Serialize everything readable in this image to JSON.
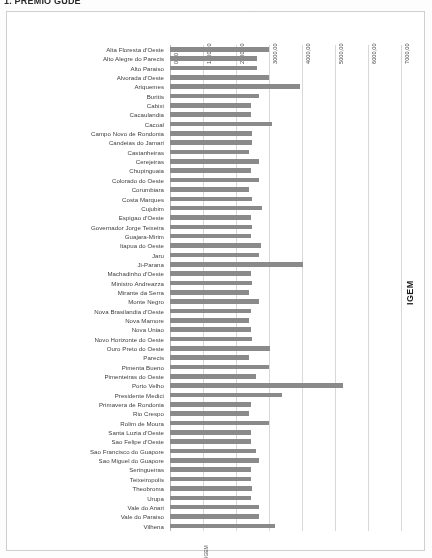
{
  "document": {
    "title": "1. PREMIO GUDE"
  },
  "series_label": "IGEM",
  "bottom_label": "IGEM",
  "chart_data": {
    "type": "bar",
    "orientation": "horizontal",
    "title": "1. PREMIO GUDE",
    "xlabel": "",
    "ylabel": "",
    "legend": [
      "IGEM"
    ],
    "legend_position": "right",
    "grid": true,
    "xlim": [
      0,
      7500
    ],
    "xticks": [
      0,
      1000,
      2000,
      3000,
      4000,
      5000,
      6000,
      7000
    ],
    "xtick_labels": [
      "0,00",
      "1000,00",
      "2000,00",
      "3000,00",
      "4000,00",
      "5000,00",
      "6000,00",
      "7000,00"
    ],
    "categories": [
      "Alta Floresta d'Oeste",
      "Alto Alegre do Parecis",
      "Alto Paraiso",
      "Alvorada d'Oeste",
      "Ariquemes",
      "Buritis",
      "Cabixi",
      "Cacaulandia",
      "Cacoal",
      "Campo Novo de Rondonia",
      "Candeias do Jamari",
      "Castanheiras",
      "Cerejeiras",
      "Chupinguaia",
      "Colorado do Oeste",
      "Corumbiara",
      "Costa Marques",
      "Cujubim",
      "Espigao d'Oeste",
      "Governador Jorge Teixeira",
      "Guajara-Mirim",
      "Itapua do Oeste",
      "Jaru",
      "Ji-Parana",
      "Machadinho d'Oeste",
      "Ministro Andreazza",
      "Mirante da Serra",
      "Monte Negro",
      "Nova Brasilandia d'Oeste",
      "Nova Mamore",
      "Nova Uniao",
      "Novo Horizonte do Oeste",
      "Ouro Preto do Oeste",
      "Parecis",
      "Pimenta Bueno",
      "Pimenteiras do Oeste",
      "Porto Velho",
      "Presidente Medici",
      "Primavera de Rondonia",
      "Rio Crespo",
      "Rolim de Moura",
      "Santa Luzia d'Oeste",
      "Sao Felipe d'Oeste",
      "Sao Francisco do Guapore",
      "Sao Miguel do Guapore",
      "Seringueiras",
      "Teixeiropolis",
      "Theobroma",
      "Urupa",
      "Vale do Anari",
      "Vale do Paraiso",
      "Vilhena"
    ],
    "values": [
      3000,
      2650,
      2650,
      3000,
      3950,
      2700,
      2450,
      2450,
      3100,
      2500,
      2500,
      2400,
      2700,
      2450,
      2700,
      2400,
      2500,
      2800,
      2450,
      2500,
      2450,
      2750,
      2700,
      4050,
      2450,
      2500,
      2400,
      2700,
      2450,
      2400,
      2450,
      2500,
      3050,
      2400,
      3000,
      2600,
      5250,
      3400,
      2450,
      2400,
      3000,
      2450,
      2450,
      2600,
      2700,
      2450,
      2450,
      2500,
      2450,
      2700,
      2700,
      3200
    ]
  }
}
